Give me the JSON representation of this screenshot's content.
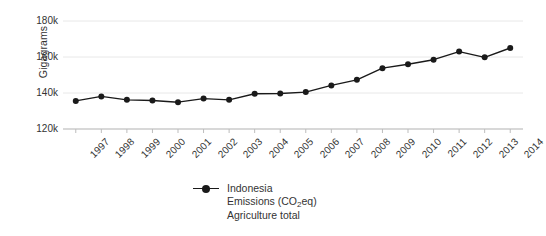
{
  "chart_data": {
    "type": "line",
    "title": "",
    "subtitle": "",
    "xlabel": "",
    "ylabel": "Gigagrams",
    "xlim": [
      1996.5,
      2014.5
    ],
    "ylim": [
      120000,
      180000
    ],
    "grid": true,
    "legend_position": "bottom-center",
    "categories": [
      "1997",
      "1998",
      "1999",
      "2000",
      "2001",
      "2002",
      "2003",
      "2004",
      "2005",
      "2006",
      "2007",
      "2008",
      "2009",
      "2010",
      "2011",
      "2012",
      "2013",
      "2014"
    ],
    "x": [
      1997,
      1998,
      1999,
      2000,
      2001,
      2002,
      2003,
      2004,
      2005,
      2006,
      2007,
      2008,
      2009,
      2010,
      2011,
      2012,
      2013,
      2014
    ],
    "series": [
      {
        "name": "Indonesia Emissions (CO2eq) Agriculture total",
        "marker": "circle",
        "color": "#1a1a1a",
        "values": [
          135600,
          138100,
          136200,
          135800,
          134900,
          136900,
          136200,
          139600,
          139700,
          140500,
          144200,
          147300,
          153800,
          156000,
          158500,
          163000,
          159800,
          165000
        ]
      }
    ],
    "ytick_values": [
      180000,
      160000,
      140000,
      120000
    ],
    "ytick_labels": [
      "180k",
      "160k",
      "140k",
      "120k"
    ],
    "xtick_labels": [
      "1997",
      "1998",
      "1999",
      "2000",
      "2001",
      "2002",
      "2003",
      "2004",
      "2005",
      "2006",
      "2007",
      "2008",
      "2009",
      "2010",
      "2011",
      "2012",
      "2013",
      "2014"
    ],
    "legend": {
      "lines": [
        "Indonesia",
        "Emissions (CO₂eq)",
        "Agriculture total"
      ],
      "line1": "Indonesia",
      "line2_pre": "Emissions (CO",
      "line2_sub": "2",
      "line2_post": "eq)",
      "line3": "Agriculture total"
    },
    "colors": {
      "line": "#1a1a1a",
      "marker": "#1a1a1a",
      "grid": "#e8e8e8",
      "axis": "#bdbdbd",
      "text": "#333333",
      "background": "#ffffff"
    }
  }
}
